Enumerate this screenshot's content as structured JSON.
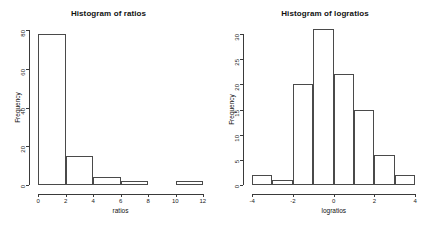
{
  "figure": {
    "background": "#ffffff",
    "foreground": "#333333",
    "panel_count": 2
  },
  "chart_data": [
    {
      "type": "bar",
      "title": "Histogram of ratios",
      "xlabel": "ratios",
      "ylabel": "Frequency",
      "grid": false,
      "legend": null,
      "xlim": [
        0,
        12
      ],
      "ylim": [
        0,
        80
      ],
      "xticks": [
        "0",
        "2",
        "4",
        "6",
        "8",
        "10",
        "12"
      ],
      "xtick_values": [
        0,
        2,
        4,
        6,
        8,
        10,
        12
      ],
      "yticks": [
        "0",
        "20",
        "40",
        "60",
        "80"
      ],
      "ytick_values": [
        0,
        20,
        40,
        60,
        80
      ],
      "bin_width": 2,
      "bin_edges": [
        0,
        2,
        4,
        6,
        8,
        10,
        12
      ],
      "categories": [
        "0-2",
        "2-4",
        "4-6",
        "6-8",
        "8-10",
        "10-12"
      ],
      "values": [
        78,
        15,
        4,
        2,
        0,
        2
      ]
    },
    {
      "type": "bar",
      "title": "Histogram of logratios",
      "xlabel": "logratios",
      "ylabel": "Frequency",
      "grid": false,
      "legend": null,
      "xlim": [
        -4,
        4
      ],
      "ylim": [
        0,
        31
      ],
      "xticks": [
        "-4",
        "-2",
        "0",
        "2",
        "4"
      ],
      "xtick_values": [
        -4,
        -2,
        0,
        2,
        4
      ],
      "yticks": [
        "0",
        "5",
        "10",
        "15",
        "20",
        "25",
        "30"
      ],
      "ytick_values": [
        0,
        5,
        10,
        15,
        20,
        25,
        30
      ],
      "bin_width": 1,
      "bin_edges": [
        -4,
        -3,
        -2,
        -1,
        0,
        1,
        2,
        3,
        4
      ],
      "categories": [
        "-4 to -3",
        "-3 to -2",
        "-2 to -1",
        "-1 to 0",
        "0 to 1",
        "1 to 2",
        "2 to 3",
        "3 to 4"
      ],
      "values": [
        2,
        1,
        20,
        31,
        22,
        15,
        6,
        2
      ]
    }
  ]
}
